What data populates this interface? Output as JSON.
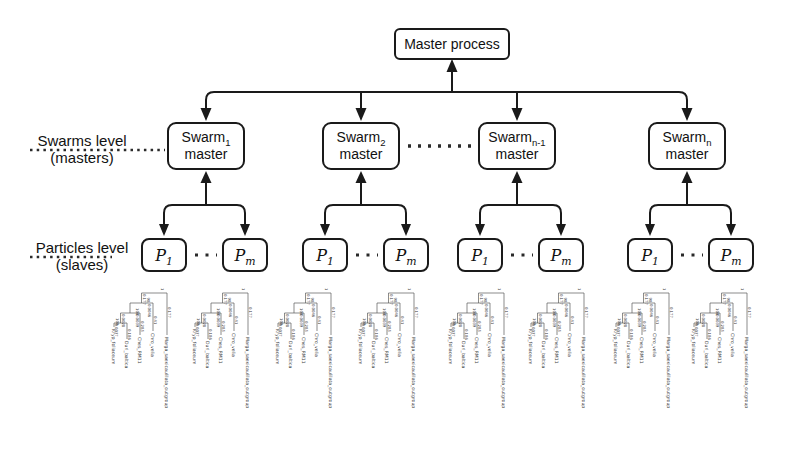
{
  "master": {
    "label": "Master process"
  },
  "swarm_level_label": {
    "line1": "Swarms level",
    "line2": "(masters)"
  },
  "particle_level_label": {
    "line1": "Particles level",
    "line2": "(slaves)"
  },
  "swarms": [
    {
      "base": "Swarm",
      "sub": "1",
      "line2": "master"
    },
    {
      "base": "Swarm",
      "sub": "2",
      "line2": "master"
    },
    {
      "base": "Swarm",
      "sub": "n-1",
      "line2": "master"
    },
    {
      "base": "Swarm",
      "sub": "n",
      "line2": "master"
    }
  ],
  "particles": {
    "first": {
      "base": "P",
      "sub": "1"
    },
    "last": {
      "base": "P",
      "sub": "m"
    }
  },
  "tree": {
    "instances": 8,
    "taxa": [
      {
        "name": "Marga_saexicaulilata_outgroup",
        "branch_length": "0.177"
      },
      {
        "name": "Chro_velia",
        "branch_length": "0.41"
      },
      {
        "name": "Ches_RM11",
        "branch_length": "0.285"
      },
      {
        "name": "Duri_baltica",
        "branch_length": "0.186"
      },
      {
        "name": "Kryp_foliaceum",
        "branch_length": "0.0037"
      }
    ],
    "internal_nodes": [
      {
        "support": "1",
        "branch_length": "0.177"
      },
      {
        "support": "98",
        "branch_length": "0.0046"
      },
      {
        "support": "100",
        "branch_length": "0.0039"
      },
      {
        "support": "100",
        "branch_length": "0.0028"
      }
    ]
  },
  "colors": {
    "line": "#1a1a1a",
    "tree_line": "#5a5a5a",
    "tree_text": "#3c3c3c",
    "background": "#ffffff"
  }
}
